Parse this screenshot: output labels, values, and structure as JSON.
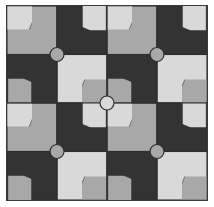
{
  "artwork": {
    "title": "Pinwheel Tile Pattern",
    "description": "Four-by-four grid of square tiles forming rotationally symmetric pinwheel motifs",
    "canvas": {
      "width": 214,
      "height": 207,
      "background": "#ffffff"
    },
    "frame": {
      "x": 6,
      "y": 5,
      "width": 202,
      "height": 196,
      "border_color": "#3a3a3a",
      "border_width": 1,
      "margin": 5
    }
  },
  "palette": {
    "light_gray": "#d9d9d9",
    "medium_gray": "#a8a8a8",
    "dark_charcoal": "#333333",
    "outline": "#2e2e2e",
    "paper_white": "#ffffff"
  },
  "grid": {
    "columns": 4,
    "rows": 4,
    "cell_width": 50,
    "cell_height": 48.5,
    "show_grid_lines": true
  },
  "chart_data": {
    "type": "heatmap",
    "xlabel": "",
    "ylabel": "",
    "grid": true,
    "legend_position": "none",
    "categories": [
      "col-1",
      "col-2",
      "col-3",
      "col-4"
    ],
    "rows": [
      "row-1",
      "row-2",
      "row-3",
      "row-4"
    ],
    "tiles": [
      {
        "row": 0,
        "col": 0,
        "background": "#a8a8a8",
        "swirl": "#d9d9d9",
        "rotation": 0
      },
      {
        "row": 0,
        "col": 1,
        "background": "#333333",
        "swirl": "#d9d9d9",
        "rotation": 90
      },
      {
        "row": 0,
        "col": 2,
        "background": "#a8a8a8",
        "swirl": "#d9d9d9",
        "rotation": 0
      },
      {
        "row": 0,
        "col": 3,
        "background": "#333333",
        "swirl": "#d9d9d9",
        "rotation": 90
      },
      {
        "row": 1,
        "col": 0,
        "background": "#333333",
        "swirl": "#a8a8a8",
        "rotation": 270
      },
      {
        "row": 1,
        "col": 1,
        "background": "#d9d9d9",
        "swirl": "#a8a8a8",
        "rotation": 180
      },
      {
        "row": 1,
        "col": 2,
        "background": "#333333",
        "swirl": "#a8a8a8",
        "rotation": 270
      },
      {
        "row": 1,
        "col": 3,
        "background": "#d9d9d9",
        "swirl": "#a8a8a8",
        "rotation": 180
      },
      {
        "row": 2,
        "col": 0,
        "background": "#a8a8a8",
        "swirl": "#d9d9d9",
        "rotation": 0
      },
      {
        "row": 2,
        "col": 1,
        "background": "#333333",
        "swirl": "#d9d9d9",
        "rotation": 90
      },
      {
        "row": 2,
        "col": 2,
        "background": "#a8a8a8",
        "swirl": "#d9d9d9",
        "rotation": 0
      },
      {
        "row": 2,
        "col": 3,
        "background": "#333333",
        "swirl": "#d9d9d9",
        "rotation": 90
      },
      {
        "row": 3,
        "col": 0,
        "background": "#333333",
        "swirl": "#a8a8a8",
        "rotation": 270
      },
      {
        "row": 3,
        "col": 1,
        "background": "#d9d9d9",
        "swirl": "#a8a8a8",
        "rotation": 180
      },
      {
        "row": 3,
        "col": 2,
        "background": "#333333",
        "swirl": "#a8a8a8",
        "rotation": 270
      },
      {
        "row": 3,
        "col": 3,
        "background": "#d9d9d9",
        "swirl": "#a8a8a8",
        "rotation": 180
      }
    ],
    "junction_circles": [
      {
        "name": "junction-top-left",
        "cx": 50,
        "cy": 48.5,
        "r": 7,
        "fill": "#a8a8a8"
      },
      {
        "name": "junction-top-right",
        "cx": 150,
        "cy": 48.5,
        "r": 7,
        "fill": "#a8a8a8"
      },
      {
        "name": "junction-center",
        "cx": 100,
        "cy": 97,
        "r": 7,
        "fill": "#d9d9d9"
      },
      {
        "name": "junction-bottom-left",
        "cx": 50,
        "cy": 145.5,
        "r": 7,
        "fill": "#a8a8a8"
      },
      {
        "name": "junction-bottom-right",
        "cx": 150,
        "cy": 145.5,
        "r": 7,
        "fill": "#a8a8a8"
      }
    ]
  }
}
